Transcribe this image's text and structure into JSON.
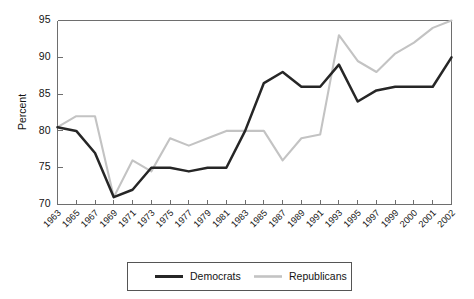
{
  "chart_data": {
    "type": "line",
    "title": "",
    "xlabel": "",
    "ylabel": "Percent",
    "ylim": [
      70,
      95
    ],
    "yticks": [
      70,
      75,
      80,
      85,
      90,
      95
    ],
    "grid": false,
    "legend_position": "bottom",
    "categories": [
      "1963",
      "1965",
      "1967",
      "1969",
      "1971",
      "1973",
      "1975",
      "1977",
      "1979",
      "1981",
      "1983",
      "1985",
      "1987",
      "1989",
      "1991",
      "1993",
      "1995",
      "1997",
      "1999",
      "2000",
      "2001",
      "2002"
    ],
    "series": [
      {
        "name": "Democrats",
        "color": "#262626",
        "values": [
          80.5,
          80.0,
          77.0,
          71.0,
          72.0,
          75.0,
          75.0,
          74.5,
          75.0,
          75.0,
          80.0,
          86.5,
          88.0,
          86.0,
          86.0,
          89.0,
          84.0,
          85.5,
          86.0,
          86.0,
          86.0,
          90.0
        ]
      },
      {
        "name": "Republicans",
        "color": "#c3c3c3",
        "values": [
          80.5,
          82.0,
          82.0,
          71.0,
          76.0,
          74.5,
          79.0,
          78.0,
          79.0,
          80.0,
          80.0,
          80.0,
          76.0,
          79.0,
          79.5,
          93.0,
          89.5,
          88.0,
          90.5,
          92.0,
          94.0,
          95.0
        ]
      }
    ]
  },
  "legend": {
    "items": [
      {
        "label": "Democrats",
        "color": "#262626"
      },
      {
        "label": "Republicans",
        "color": "#c3c3c3"
      }
    ]
  }
}
